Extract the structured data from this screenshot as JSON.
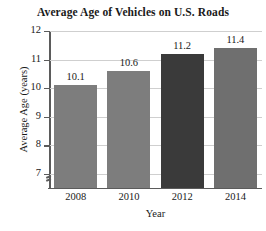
{
  "chart_data": {
    "type": "bar",
    "title": "Average Age of Vehicles on U.S. Roads",
    "xlabel": "Year",
    "ylabel": "Average Age (years)",
    "categories": [
      "2008",
      "2010",
      "2012",
      "2014"
    ],
    "values": [
      10.1,
      10.6,
      11.2,
      11.4
    ],
    "value_labels": [
      "10.1",
      "10.6",
      "11.2",
      "11.4"
    ],
    "ylim": [
      6.5,
      12
    ],
    "yticks": [
      7,
      8,
      9,
      10,
      11,
      12
    ],
    "ytick_labels": [
      "7",
      "8",
      "9",
      "10",
      "11",
      "12"
    ],
    "grid": true,
    "axis_break": true,
    "legend": "none",
    "bar_colors": [
      "#7d7d7d",
      "#7d7d7d",
      "#3a3a3a",
      "#6f6f6f"
    ],
    "grid_color": "#cfcfcf",
    "axis_color": "#5b5b5b",
    "background": "#ffffff"
  }
}
